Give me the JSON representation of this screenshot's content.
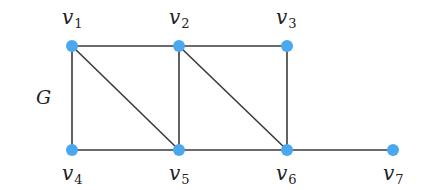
{
  "graph": {
    "name": "G",
    "name_pos": {
      "x": 36,
      "y": 104
    },
    "node_color": "#4aa8ee",
    "edge_color": "#3a3a3a",
    "nodes": [
      {
        "id": "v1",
        "base": "v",
        "sub": "1",
        "x": 72,
        "y": 46,
        "lx": 62,
        "ly": 24
      },
      {
        "id": "v2",
        "base": "v",
        "sub": "2",
        "x": 179,
        "y": 46,
        "lx": 169,
        "ly": 24
      },
      {
        "id": "v3",
        "base": "v",
        "sub": "3",
        "x": 287,
        "y": 46,
        "lx": 276,
        "ly": 24
      },
      {
        "id": "v4",
        "base": "v",
        "sub": "4",
        "x": 72,
        "y": 150,
        "lx": 62,
        "ly": 180
      },
      {
        "id": "v5",
        "base": "v",
        "sub": "5",
        "x": 179,
        "y": 150,
        "lx": 169,
        "ly": 180
      },
      {
        "id": "v6",
        "base": "v",
        "sub": "6",
        "x": 287,
        "y": 150,
        "lx": 276,
        "ly": 180
      },
      {
        "id": "v7",
        "base": "v",
        "sub": "7",
        "x": 393,
        "y": 150,
        "lx": 383,
        "ly": 180
      }
    ],
    "edges": [
      [
        "v1",
        "v2"
      ],
      [
        "v2",
        "v3"
      ],
      [
        "v1",
        "v4"
      ],
      [
        "v1",
        "v5"
      ],
      [
        "v2",
        "v5"
      ],
      [
        "v2",
        "v6"
      ],
      [
        "v3",
        "v6"
      ],
      [
        "v4",
        "v5"
      ],
      [
        "v5",
        "v6"
      ],
      [
        "v6",
        "v7"
      ]
    ]
  }
}
